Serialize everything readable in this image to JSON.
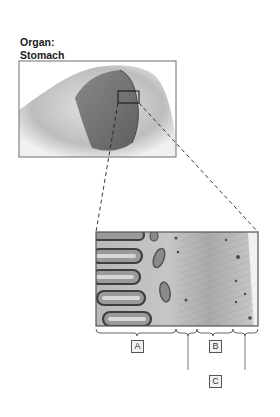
{
  "title": {
    "line1": "Organ:",
    "line2": "Stomach"
  },
  "organ_view": {
    "description": "cutaway illustration of stomach wall",
    "magnified_region": "small square on inner stomach wall"
  },
  "micrograph": {
    "description": "histological section of stomach wall showing gastric glands, submucosa and muscular layers"
  },
  "labels": {
    "a": "A",
    "b": "B",
    "c": "C"
  },
  "colors": {
    "frame": "#6e6e6e",
    "dash": "#222222",
    "tissue_dark": "#5a5a5a",
    "tissue_light": "#c9c9c9"
  }
}
